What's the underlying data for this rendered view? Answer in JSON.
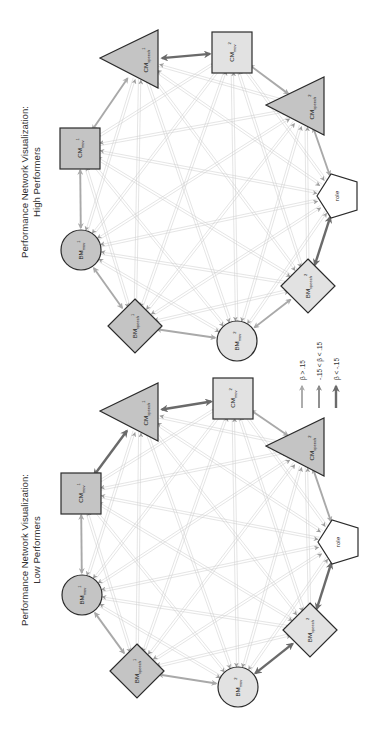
{
  "figure": {
    "orientation": "rotated-90-ccw",
    "colors": {
      "background": "#ffffff",
      "node_stroke": "#2b2b2b",
      "node_fill_dark": "#c4c4c4",
      "node_fill_light": "#e2e2e2",
      "node_fill_role": "#ffffff",
      "edge_thin": "#cfcfcf",
      "arrow_positive": "#a9a9a9",
      "arrow_neutral": "#8a8a8a",
      "arrow_negative": "#6a6a6a"
    }
  },
  "panels": [
    {
      "id": "high",
      "title_line1": "Performance Network Visualization:",
      "title_line2": "High Performers",
      "title_pos": [
        28,
        182
      ],
      "nodes": [
        {
          "id": "CMs1",
          "base": "CM",
          "sub": "speech",
          "sup": "1",
          "shape": "triangle",
          "fill": "dark",
          "cx": 140,
          "cy": 60
        },
        {
          "id": "CMm2",
          "base": "CM",
          "sub": "mov",
          "sup": "2",
          "shape": "square",
          "fill": "light",
          "cx": 232,
          "cy": 52
        },
        {
          "id": "CMs2",
          "base": "CM",
          "sub": "speech",
          "sup": "2",
          "shape": "triangle",
          "fill": "dark",
          "cx": 306,
          "cy": 107
        },
        {
          "id": "role",
          "base": "role",
          "sub": "",
          "sup": "",
          "shape": "pentagon",
          "fill": "role",
          "cx": 337,
          "cy": 196
        },
        {
          "id": "BMs2",
          "base": "BM",
          "sub": "speech",
          "sup": "2",
          "shape": "diamond",
          "fill": "light",
          "cx": 308,
          "cy": 286
        },
        {
          "id": "BMm2",
          "base": "BM",
          "sub": "mov",
          "sup": "2",
          "shape": "circle",
          "fill": "light",
          "cx": 237,
          "cy": 341
        },
        {
          "id": "BMs1",
          "base": "BM",
          "sub": "speech",
          "sup": "1",
          "shape": "diamond",
          "fill": "dark",
          "cx": 135,
          "cy": 326
        },
        {
          "id": "BMm1",
          "base": "BM",
          "sub": "mov",
          "sup": "1",
          "shape": "circle",
          "fill": "dark",
          "cx": 81,
          "cy": 250
        },
        {
          "id": "CMm1",
          "base": "CM",
          "sub": "mov",
          "sup": "1",
          "shape": "square",
          "fill": "dark",
          "cx": 80,
          "cy": 148
        }
      ]
    },
    {
      "id": "low",
      "title_line1": "Performance Network Visualization:",
      "title_line2": "Low Performers",
      "title_pos": [
        28,
        550
      ],
      "nodes": [
        {
          "id": "CMs1",
          "base": "CM",
          "sub": "speech",
          "sup": "1",
          "shape": "triangle",
          "fill": "dark",
          "cx": 140,
          "cy": 413
        },
        {
          "id": "CMm2",
          "base": "CM",
          "sub": "mov",
          "sup": "2",
          "shape": "square",
          "fill": "light",
          "cx": 233,
          "cy": 398
        },
        {
          "id": "CMs2",
          "base": "CM",
          "sub": "speech",
          "sup": "2",
          "shape": "triangle",
          "fill": "dark",
          "cx": 306,
          "cy": 448
        },
        {
          "id": "role",
          "base": "role",
          "sub": "",
          "sup": "",
          "shape": "pentagon",
          "fill": "role",
          "cx": 338,
          "cy": 542
        },
        {
          "id": "BMs2",
          "base": "BM",
          "sub": "speech",
          "sup": "2",
          "shape": "diamond",
          "fill": "light",
          "cx": 310,
          "cy": 630
        },
        {
          "id": "BMm2",
          "base": "BM",
          "sub": "mov",
          "sup": "2",
          "shape": "circle",
          "fill": "light",
          "cx": 238,
          "cy": 687
        },
        {
          "id": "BMs1",
          "base": "BM",
          "sub": "speech",
          "sup": "1",
          "shape": "diamond",
          "fill": "dark",
          "cx": 137,
          "cy": 671
        },
        {
          "id": "BMm1",
          "base": "BM",
          "sub": "mov",
          "sup": "1",
          "shape": "circle",
          "fill": "dark",
          "cx": 82,
          "cy": 595
        },
        {
          "id": "CMm1",
          "base": "CM",
          "sub": "mov",
          "sup": "1",
          "shape": "square",
          "fill": "dark",
          "cx": 81,
          "cy": 493
        }
      ]
    }
  ],
  "legend": {
    "items": [
      {
        "label": "β > .15",
        "level": "positive",
        "x": 302
      },
      {
        "label": "-.15 < β < .15",
        "level": "neutral",
        "x": 319
      },
      {
        "label": "β < -.15",
        "level": "negative",
        "x": 336
      }
    ],
    "arrow_top": 386,
    "arrow_bottom": 408,
    "text_bottom": 380
  },
  "edges_note": "All node pairs connected by thin light gray lines with arrowheads; adjacent nodes connected by bidirectional arrows shaded by beta level.",
  "adjacent_levels_high": [
    "negative",
    "positive",
    "positive",
    "negative",
    "positive",
    "positive",
    "positive",
    "positive",
    "positive"
  ],
  "adjacent_levels_low": [
    "negative",
    "positive",
    "positive",
    "negative",
    "negative",
    "positive",
    "positive",
    "positive",
    "negative"
  ]
}
